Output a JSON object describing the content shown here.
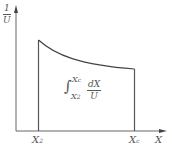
{
  "diagram": {
    "y_axis_label": {
      "numerator": "1",
      "denominator": "U"
    },
    "x_axis_label": "X",
    "x_ticks": [
      {
        "label": "X",
        "subscript": "2"
      },
      {
        "label": "X",
        "subscript": "c"
      }
    ],
    "integral": {
      "symbol": "∫",
      "upper": "X",
      "upper_sub": "c",
      "lower": "X",
      "lower_sub": "2",
      "integrand_numerator": "dX",
      "integrand_denominator": "U"
    },
    "colors": {
      "line": "#555555",
      "background": "#ffffff"
    }
  }
}
